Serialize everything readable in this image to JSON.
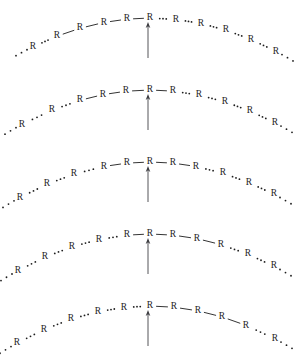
{
  "figure": {
    "unit_label": "R",
    "background_color": "#ffffff",
    "ink_color": "#1d1d1d",
    "arrow_color": "#555558",
    "width": 294,
    "height": 361,
    "frame_count": 5,
    "arrow": {
      "name": "propagation-arrow",
      "x": 148,
      "tip_y_offset": 22,
      "tail_y_offset": 58,
      "direction": "up"
    },
    "arc": {
      "apex_x": 150,
      "apex_y": 18,
      "curvature": 0.0021,
      "description": "Shallow downward-opening parabola; R units are placed along it."
    },
    "dot_separator": {
      "name": "ellipsis-separator",
      "dot_count": 3,
      "dot_radius": 0.9,
      "meaning": "unbonded / continuing chain"
    },
    "bond": {
      "name": "solid-bond",
      "meaning": "bonded neighbouring R units",
      "stroke_width": 0.9
    },
    "frames": [
      {
        "index": 1,
        "name": "frame-1",
        "top": 0,
        "bonded_run_start_index": 2,
        "bonded_run_length": 5,
        "arrow_target_label": "R",
        "arrow_target_index": 6,
        "units": [
          {
            "label": "R",
            "x": 33,
            "bond_to_next": false
          },
          {
            "label": "R",
            "x": 57,
            "bond_to_next": true
          },
          {
            "label": "R",
            "x": 80,
            "bond_to_next": true
          },
          {
            "label": "R",
            "x": 104,
            "bond_to_next": true
          },
          {
            "label": "R",
            "x": 127,
            "bond_to_next": true
          },
          {
            "label": "R",
            "x": 150,
            "bond_to_next": false
          },
          {
            "label": "R",
            "x": 176,
            "bond_to_next": false
          },
          {
            "label": "R",
            "x": 201,
            "bond_to_next": false
          },
          {
            "label": "R",
            "x": 226,
            "bond_to_next": false
          },
          {
            "label": "R",
            "x": 251,
            "bond_to_next": false
          },
          {
            "label": "R",
            "x": 276,
            "bond_to_next": false
          }
        ],
        "lead_dots": true,
        "trail_dots": true
      },
      {
        "index": 2,
        "name": "frame-2",
        "top": 72,
        "bonded_run_start_index": 3,
        "bonded_run_length": 5,
        "arrow_target_label": "R",
        "arrow_target_index": 6,
        "units": [
          {
            "label": "R",
            "x": 22,
            "bond_to_next": false
          },
          {
            "label": "R",
            "x": 52,
            "bond_to_next": false
          },
          {
            "label": "R",
            "x": 80,
            "bond_to_next": true
          },
          {
            "label": "R",
            "x": 103,
            "bond_to_next": true
          },
          {
            "label": "R",
            "x": 126,
            "bond_to_next": true
          },
          {
            "label": "R",
            "x": 150,
            "bond_to_next": true
          },
          {
            "label": "R",
            "x": 173,
            "bond_to_next": false
          },
          {
            "label": "R",
            "x": 199,
            "bond_to_next": false
          },
          {
            "label": "R",
            "x": 225,
            "bond_to_next": false
          },
          {
            "label": "R",
            "x": 250,
            "bond_to_next": false
          },
          {
            "label": "R",
            "x": 275,
            "bond_to_next": false
          }
        ],
        "lead_dots": true,
        "trail_dots": true
      },
      {
        "index": 3,
        "name": "frame-3",
        "top": 144,
        "bonded_run_start_index": 4,
        "bonded_run_length": 5,
        "arrow_target_label": "R",
        "arrow_target_index": 6,
        "units": [
          {
            "label": "R",
            "x": 20,
            "bond_to_next": false
          },
          {
            "label": "R",
            "x": 47,
            "bond_to_next": false
          },
          {
            "label": "R",
            "x": 74,
            "bond_to_next": false
          },
          {
            "label": "R",
            "x": 104,
            "bond_to_next": true
          },
          {
            "label": "R",
            "x": 127,
            "bond_to_next": true
          },
          {
            "label": "R",
            "x": 150,
            "bond_to_next": true
          },
          {
            "label": "R",
            "x": 173,
            "bond_to_next": true
          },
          {
            "label": "R",
            "x": 196,
            "bond_to_next": false
          },
          {
            "label": "R",
            "x": 223,
            "bond_to_next": false
          },
          {
            "label": "R",
            "x": 249,
            "bond_to_next": false
          },
          {
            "label": "R",
            "x": 274,
            "bond_to_next": false
          }
        ],
        "lead_dots": true,
        "trail_dots": true
      },
      {
        "index": 4,
        "name": "frame-4",
        "top": 216,
        "bonded_run_start_index": 5,
        "bonded_run_length": 5,
        "arrow_target_label": "R",
        "arrow_target_index": 6,
        "units": [
          {
            "label": "R",
            "x": 18,
            "bond_to_next": false
          },
          {
            "label": "R",
            "x": 45,
            "bond_to_next": false
          },
          {
            "label": "R",
            "x": 72,
            "bond_to_next": false
          },
          {
            "label": "R",
            "x": 99,
            "bond_to_next": false
          },
          {
            "label": "R",
            "x": 127,
            "bond_to_next": true
          },
          {
            "label": "R",
            "x": 150,
            "bond_to_next": true
          },
          {
            "label": "R",
            "x": 173,
            "bond_to_next": true
          },
          {
            "label": "R",
            "x": 197,
            "bond_to_next": true
          },
          {
            "label": "R",
            "x": 221,
            "bond_to_next": false
          },
          {
            "label": "R",
            "x": 248,
            "bond_to_next": false
          },
          {
            "label": "R",
            "x": 274,
            "bond_to_next": false
          }
        ],
        "lead_dots": true,
        "trail_dots": true
      },
      {
        "index": 5,
        "name": "frame-5",
        "top": 288,
        "bonded_run_start_index": 6,
        "bonded_run_length": 5,
        "arrow_target_label": "R",
        "arrow_target_index": 6,
        "units": [
          {
            "label": "R",
            "x": 17,
            "bond_to_next": false
          },
          {
            "label": "R",
            "x": 44,
            "bond_to_next": false
          },
          {
            "label": "R",
            "x": 71,
            "bond_to_next": false
          },
          {
            "label": "R",
            "x": 98,
            "bond_to_next": false
          },
          {
            "label": "R",
            "x": 124,
            "bond_to_next": false
          },
          {
            "label": "R",
            "x": 150,
            "bond_to_next": true
          },
          {
            "label": "R",
            "x": 174,
            "bond_to_next": true
          },
          {
            "label": "R",
            "x": 198,
            "bond_to_next": true
          },
          {
            "label": "R",
            "x": 222,
            "bond_to_next": true
          },
          {
            "label": "R",
            "x": 246,
            "bond_to_next": false
          },
          {
            "label": "R",
            "x": 275,
            "bond_to_next": false
          }
        ],
        "lead_dots": true,
        "trail_dots": true
      }
    ]
  }
}
